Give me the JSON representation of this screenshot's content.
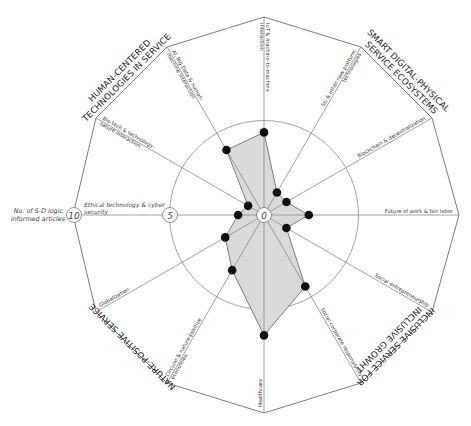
{
  "chart_data": {
    "type": "radar",
    "title": "",
    "axis_title": [
      "No. of S-D logic",
      "informed articles"
    ],
    "scale": {
      "min": 0,
      "max": 10,
      "ticks": [
        0,
        5,
        10
      ],
      "rings": [
        5
      ]
    },
    "categories": [
      "IoT & machine-to-machine interaction",
      "5G & other new platform technologies",
      "Blockchain & decentralization",
      "Future of work & fair labor",
      "Social entrepreneurship",
      "Social corporate responsibility",
      "Healthcare",
      "Circular & nature-positive economies",
      "Globalization",
      "Ethical technology & cyber security",
      "Bio-tech & technology-nature interaction",
      "AI, Big Data & human-machine interaction"
    ],
    "label_lines": [
      [
        "IoT & machine-to-machine",
        "interaction"
      ],
      [
        "5G & other new platform",
        "technologies"
      ],
      [
        "Blockchain & decentralization"
      ],
      [
        "Future of work & fair labor"
      ],
      [
        "Social entrepreneurship"
      ],
      [
        "Social corporate responsibility"
      ],
      [
        "Healthcare"
      ],
      [
        "Circular & nature-positive",
        "economies"
      ],
      [
        "Globalization"
      ],
      [
        "Ethical technology & cyber",
        "security"
      ],
      [
        "Bio-tech & technology-",
        "nature interaction"
      ],
      [
        "AI, Big Data & human-",
        "machine interaction"
      ]
    ],
    "series": [
      {
        "name": "No. of S-D logic informed articles",
        "values": [
          4,
          1,
          1,
          2,
          1,
          4,
          6,
          3,
          2,
          1,
          0.6,
          3.6
        ]
      }
    ],
    "themes": [
      {
        "lines": [
          "SMART DIGITAL-PHYSICAL",
          "SERVICE ECOSYSTEMS"
        ],
        "categories": [
          0,
          1,
          2
        ]
      },
      {
        "lines": [
          "INCLUSIVE SERVICE FOR",
          "INCLUSIVE GROWHT"
        ],
        "categories": [
          3,
          4,
          5
        ]
      },
      {
        "lines": [
          "NATURE-POSITIVE SERVICE"
        ],
        "categories": [
          6,
          7,
          8
        ]
      },
      {
        "lines": [
          "HUMAN-CENTERED",
          "TECHNOLOGIES IN SERVICE"
        ],
        "categories": [
          9,
          10,
          11
        ]
      }
    ],
    "tick_labels": {
      "center": "0",
      "mid": "5",
      "outer": "10"
    },
    "colors": {
      "fill": "#d9d9d9",
      "stroke": "#707070",
      "marker": "#111111",
      "grid": "#8a8a8a"
    },
    "grid": true,
    "legend": "none"
  }
}
